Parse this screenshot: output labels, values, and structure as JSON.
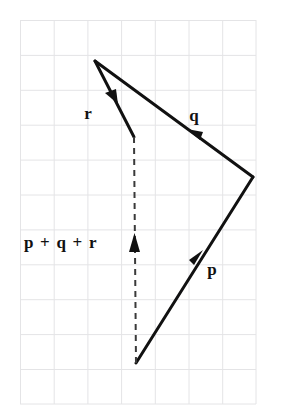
{
  "figure": {
    "background_color": "#ffffff",
    "stroke_color": "#111111",
    "grid": {
      "visible": true,
      "line_color": "#e2e2e4",
      "border_color": "#dcdcde",
      "x_start": 20,
      "y_start": 20,
      "x_end": 256,
      "y_end": 404,
      "columns": 7,
      "rows": 11,
      "cell_width": 33.7,
      "cell_height": 34.9
    },
    "corner_artifact": {
      "glyph": "█",
      "visible": true
    },
    "labels": {
      "r": "r",
      "q": "q",
      "p": "p",
      "resultant": "p + q + r"
    },
    "label_positions": {
      "r": {
        "x": 88,
        "y": 119,
        "font_size": 17
      },
      "q": {
        "x": 189,
        "y": 121,
        "font_size": 17
      },
      "p": {
        "x": 206,
        "y": 274,
        "font_size": 17
      },
      "resultant": {
        "x": 24,
        "y": 248,
        "font_size": 17
      }
    },
    "vectors": [
      {
        "name": "p",
        "label": "p",
        "style": "solid",
        "from": {
          "x": 136,
          "y": 363
        },
        "to": {
          "x": 253,
          "y": 177
        },
        "arrowhead_at": {
          "x": 200,
          "y": 256
        },
        "arrow_direction": "up-right"
      },
      {
        "name": "q",
        "label": "q",
        "style": "solid",
        "from": {
          "x": 253,
          "y": 177
        },
        "to": {
          "x": 95,
          "y": 61
        },
        "arrowhead_at": {
          "x": 192,
          "y": 133
        },
        "arrow_direction": "up-left"
      },
      {
        "name": "r",
        "label": "r",
        "style": "solid",
        "from": {
          "x": 95,
          "y": 61
        },
        "to": {
          "x": 134,
          "y": 137
        },
        "arrowhead_at": {
          "x": 115,
          "y": 99
        },
        "arrow_direction": "down-right"
      },
      {
        "name": "resultant",
        "label": "p + q + r",
        "style": "dashed",
        "from": {
          "x": 136,
          "y": 363
        },
        "to": {
          "x": 134,
          "y": 137
        },
        "arrowhead_at": {
          "x": 134,
          "y": 239
        },
        "arrow_direction": "up",
        "dash_pattern": "6 5"
      }
    ]
  }
}
